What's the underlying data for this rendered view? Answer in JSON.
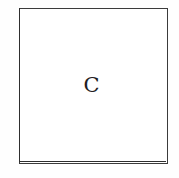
{
  "figure": {
    "type": "labeled-rectangle-diagram",
    "canvas": {
      "width_px": 179,
      "height_px": 178,
      "background_color": "#ffffff"
    },
    "box": {
      "name": "outlined-square",
      "x_px": 19,
      "y_px": 8,
      "width_px": 149,
      "height_px": 156,
      "stroke_color": "#3b3b3b",
      "stroke_width_px": 1.5,
      "fill_color": "#ffffff"
    },
    "label": {
      "text": "C",
      "color": "#23201f",
      "font_size_px": 21,
      "center_x_px": 94,
      "center_y_px": 83
    }
  }
}
